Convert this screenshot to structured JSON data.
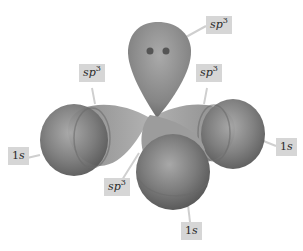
{
  "diagram": {
    "colors": {
      "background": "#ffffff",
      "label_box": "#d6d6d6",
      "leader_line": "#c8c8c8",
      "orbital_dark": "#6e6e6e",
      "orbital_light": "#b4b4b4",
      "lone_pair_dot": "#555555"
    },
    "labels": [
      {
        "id": "sp3-top",
        "base": "sp",
        "sup": "3"
      },
      {
        "id": "sp3-left",
        "base": "sp",
        "sup": "3"
      },
      {
        "id": "sp3-right",
        "base": "sp",
        "sup": "3"
      },
      {
        "id": "sp3-front",
        "base": "sp",
        "sup": "3"
      },
      {
        "id": "1s-left",
        "base": "1",
        "italic": "s"
      },
      {
        "id": "1s-right",
        "base": "1",
        "italic": "s"
      },
      {
        "id": "1s-bottom",
        "base": "1",
        "italic": "s"
      }
    ]
  }
}
